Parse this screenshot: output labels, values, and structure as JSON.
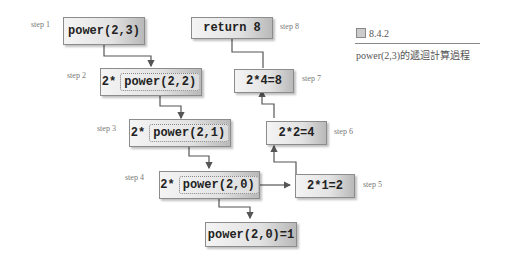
{
  "caption": {
    "figure_number": "8.4.2",
    "text": "power(2,3)的遞迴計算過程"
  },
  "nodes": {
    "step1": {
      "step": "step 1",
      "label": "power(2,3)"
    },
    "step2": {
      "step": "step 2",
      "prefix": "2*",
      "inner": "power(2,2)"
    },
    "step3": {
      "step": "step 3",
      "prefix": "2*",
      "inner": "power(2,1)"
    },
    "step4": {
      "step": "step 4",
      "prefix": "2*",
      "inner": "power(2,0)"
    },
    "base": {
      "label": "power(2,0)=1"
    },
    "step5": {
      "step": "step 5",
      "label": "2*1=2"
    },
    "step6": {
      "step": "step 6",
      "label": "2*2=4"
    },
    "step7": {
      "step": "step 7",
      "label": "2*4=8"
    },
    "step8": {
      "step": "step 8",
      "label": "return 8"
    }
  }
}
